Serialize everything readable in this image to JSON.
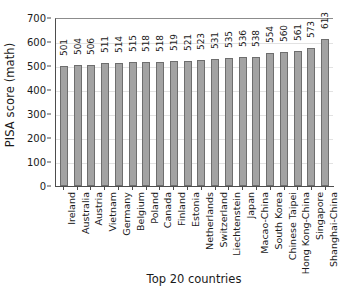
{
  "chart_data": {
    "type": "bar",
    "title": "",
    "xlabel": "Top 20 countries",
    "ylabel": "PISA score (math)",
    "ylim": [
      0,
      700
    ],
    "ytick_labels": [
      "0",
      "100",
      "200",
      "300",
      "400",
      "500",
      "600",
      "700"
    ],
    "ytick_values": [
      0,
      100,
      200,
      300,
      400,
      500,
      600,
      700
    ],
    "grid": true,
    "legend": "none",
    "bar_color": "#a3a3a3",
    "bar_edge_color": "#6e6e6e",
    "axis_color": "#4d4d4d",
    "categories": [
      "Ireland",
      "Australia",
      "Austria",
      "Vietnam",
      "Germany",
      "Belgium",
      "Poland",
      "Canada",
      "Finland",
      "Estonia",
      "Netherlands",
      "Switzerland",
      "Liechtenstein",
      "Japan",
      "Macao-China",
      "South Korea",
      "Chinese Taipei",
      "Hong Kong-China",
      "Singapore",
      "Shanghai-China"
    ],
    "values": [
      501,
      504,
      506,
      511,
      514,
      515,
      518,
      518,
      519,
      521,
      523,
      531,
      535,
      536,
      538,
      554,
      560,
      561,
      573,
      613
    ],
    "value_labels": [
      "501",
      "504",
      "506",
      "511",
      "514",
      "515",
      "518",
      "518",
      "519",
      "521",
      "523",
      "531",
      "535",
      "536",
      "538",
      "554",
      "560",
      "561",
      "573",
      "613"
    ]
  }
}
